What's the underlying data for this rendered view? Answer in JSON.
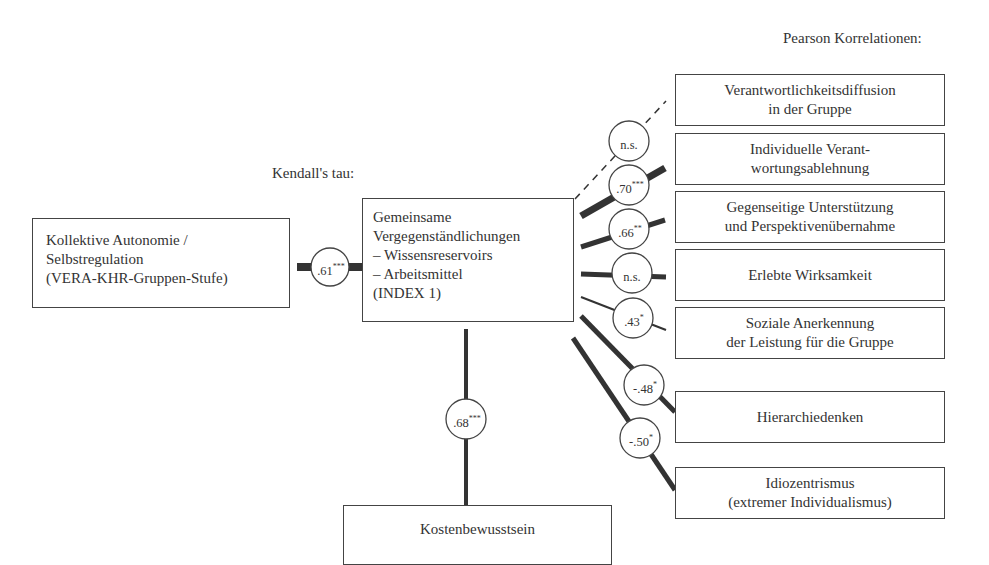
{
  "headers": {
    "pearson": "Pearson Korrelationen:",
    "kendall": "Kendall's tau:"
  },
  "source_node": {
    "lines": [
      "Kollektive Autonomie /",
      "Selbstregulation",
      "(VERA-KHR-Gruppen-Stufe)"
    ]
  },
  "center_node": {
    "lines": [
      "Gemeinsame",
      "Vergegenständlichungen",
      "– Wissensreservoirs",
      "– Arbeitsmittel",
      "(INDEX 1)"
    ]
  },
  "bottom_node": {
    "label": "Kostenbewusstsein"
  },
  "edges": {
    "source_to_center": {
      "value": ".61",
      "sig": "***"
    },
    "center_to_bottom": {
      "value": ".68",
      "sig": "***"
    }
  },
  "targets": [
    {
      "lines": [
        "Verantwortlichkeitsdiffusion",
        "in der Gruppe"
      ],
      "value": "n.s.",
      "sig": ""
    },
    {
      "lines": [
        "Individuelle Verant-",
        "wortungsablehnung"
      ],
      "value": ".70",
      "sig": "***"
    },
    {
      "lines": [
        "Gegenseitige Unterstützung",
        "und Perspektivenübernahme"
      ],
      "value": ".66",
      "sig": "**"
    },
    {
      "lines": [
        "Erlebte Wirksamkeit"
      ],
      "value": "n.s.",
      "sig": ""
    },
    {
      "lines": [
        "Soziale Anerkennung",
        "der Leistung für die Gruppe"
      ],
      "value": ".43",
      "sig": "*"
    },
    {
      "lines": [
        "Hierarchiedenken"
      ],
      "value": "-.48",
      "sig": "*"
    },
    {
      "lines": [
        "Idiozentrismus",
        "(extremer Individualismus)"
      ],
      "value": "-.50",
      "sig": "*"
    }
  ],
  "colors": {
    "line": "#333333",
    "border": "#444444",
    "text": "#333333",
    "background": "#ffffff"
  }
}
